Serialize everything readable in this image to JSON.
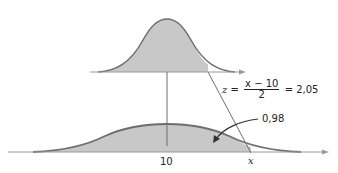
{
  "diagram": {
    "top_curve": {
      "description": "standard normal curve, shaded up to z"
    },
    "bottom_curve": {
      "description": "normal curve with mean 10, shaded up to x"
    },
    "labels": {
      "mean_tick": "10",
      "x_tick": "x",
      "area": "0,98",
      "formula_z": "z",
      "formula_eq": "=",
      "formula_num": "x − 10",
      "formula_den": "2",
      "formula_result": "= 2,05"
    },
    "colors": {
      "curve": "#6e6e6e",
      "shade": "#c8c8c8",
      "axis": "#9a9a9a",
      "text": "#222222"
    }
  }
}
